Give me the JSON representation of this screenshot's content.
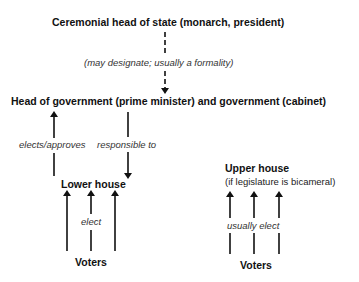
{
  "diagram": {
    "title_node": "Ceremonial head of state (monarch, president)",
    "designate_label": "(may designate; usually a formality)",
    "government_node": "Head of government (prime minister) and government (cabinet)",
    "elects_label": "elects/approves",
    "responsible_label": "responsible to",
    "lower_house": {
      "label": "Lower house",
      "elect_label": "elect",
      "voters_label": "Voters"
    },
    "upper_house": {
      "label": "Upper house",
      "note": "(if legislature is bicameral)",
      "elect_label": "usually elect",
      "voters_label": "Voters"
    },
    "colors": {
      "line": "#111111",
      "text": "#111111",
      "italic_text": "#333333"
    }
  }
}
